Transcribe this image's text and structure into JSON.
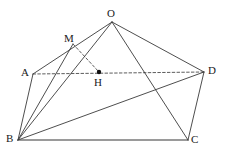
{
  "figure": {
    "type": "geometry-diagram",
    "width": 229,
    "height": 158,
    "background": "#ffffff",
    "stroke_color": "#3a3a3a",
    "base_edge_color": "#7a7a7a",
    "dashed_color": "#4a4a4a",
    "point_fill": "#111111",
    "points": [
      {
        "id": "O",
        "label": "O",
        "x": 112,
        "y": 22,
        "label_x": 107,
        "label_y": 8,
        "dotted": false
      },
      {
        "id": "M",
        "label": "M",
        "x": 73,
        "y": 44,
        "label_x": 64,
        "label_y": 33,
        "dotted": false
      },
      {
        "id": "A",
        "label": "A",
        "x": 33,
        "y": 74,
        "label_x": 21,
        "label_y": 67,
        "dotted": false
      },
      {
        "id": "D",
        "label": "D",
        "x": 204,
        "y": 72,
        "label_x": 208,
        "label_y": 65,
        "dotted": false
      },
      {
        "id": "H",
        "label": "H",
        "x": 99,
        "y": 72,
        "label_x": 94,
        "label_y": 77,
        "dotted": true
      },
      {
        "id": "B",
        "label": "B",
        "x": 18,
        "y": 140,
        "label_x": 6,
        "label_y": 133,
        "dotted": false
      },
      {
        "id": "C",
        "label": "C",
        "x": 188,
        "y": 140,
        "label_x": 191,
        "label_y": 134,
        "dotted": false
      }
    ],
    "solid_edges": [
      {
        "name": "edge-A-O",
        "from": "A",
        "to": "O"
      },
      {
        "name": "edge-O-D",
        "from": "O",
        "to": "D"
      },
      {
        "name": "edge-O-B",
        "from": "O",
        "to": "B"
      },
      {
        "name": "edge-O-C",
        "from": "O",
        "to": "C"
      },
      {
        "name": "edge-A-B",
        "from": "A",
        "to": "B"
      },
      {
        "name": "edge-B-M",
        "from": "B",
        "to": "M"
      },
      {
        "name": "edge-B-D",
        "from": "B",
        "to": "D"
      },
      {
        "name": "edge-D-C",
        "from": "D",
        "to": "C"
      }
    ],
    "base_edges": [
      {
        "name": "edge-B-C",
        "from": "B",
        "to": "C"
      }
    ],
    "dashed_edges": [
      {
        "name": "edge-A-D-dashed",
        "from": "A",
        "to": "D"
      },
      {
        "name": "edge-M-H-dashed",
        "from": "M",
        "to": "H"
      }
    ]
  }
}
